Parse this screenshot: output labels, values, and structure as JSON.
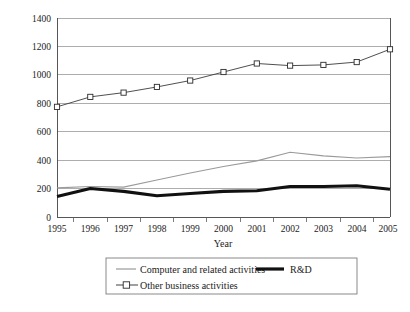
{
  "chart_data": {
    "type": "line",
    "title": "",
    "subtitle": "",
    "xlabel": "Year",
    "ylabel": "",
    "categories": [
      "1995",
      "1996",
      "1997",
      "1998",
      "1999",
      "2000",
      "2001",
      "2002",
      "2003",
      "2004",
      "2005"
    ],
    "x": [
      1995,
      1996,
      1997,
      1998,
      1999,
      2000,
      2001,
      2002,
      2003,
      2004,
      2005
    ],
    "xlim": [
      1995,
      2005
    ],
    "ylim": [
      0,
      1400
    ],
    "yticks": [
      0,
      200,
      400,
      600,
      800,
      1000,
      1200,
      1400
    ],
    "ytick_labels": [
      "0",
      "200",
      "400",
      "600",
      "800",
      "1000",
      "1200",
      "1400"
    ],
    "grid": "horizontal",
    "legend_position": "bottom",
    "series": [
      {
        "name": "Computer and related activities",
        "style": "thin-gray-line",
        "color": "#9a9a9a",
        "marker": "none",
        "values": [
          205,
          215,
          210,
          260,
          310,
          355,
          395,
          455,
          430,
          415,
          425
        ]
      },
      {
        "name": "R&D",
        "style": "thick-black-line",
        "color": "#111111",
        "marker": "none",
        "values": [
          145,
          200,
          180,
          150,
          165,
          180,
          185,
          215,
          215,
          220,
          195
        ]
      },
      {
        "name": "Other business activities",
        "style": "thin-line-open-square",
        "color": "#2b2b2b",
        "marker": "open-square",
        "values": [
          775,
          845,
          875,
          915,
          960,
          1020,
          1080,
          1065,
          1070,
          1090,
          1180
        ]
      }
    ]
  },
  "axes": {
    "x_title": "Year",
    "y_tick_labels": [
      "1400",
      "1200",
      "1000",
      "800",
      "600",
      "400",
      "200",
      "0"
    ],
    "x_tick_labels": [
      "1995",
      "1996",
      "1997",
      "1998",
      "1999",
      "2000",
      "2001",
      "2002",
      "2003",
      "2004",
      "2005"
    ]
  },
  "legend": {
    "entries": [
      {
        "label": "Computer and related activities",
        "marker": "line-gray"
      },
      {
        "label": "R&D",
        "marker": "line-thick-black"
      },
      {
        "label": "Other business activities",
        "marker": "line-square"
      }
    ]
  }
}
